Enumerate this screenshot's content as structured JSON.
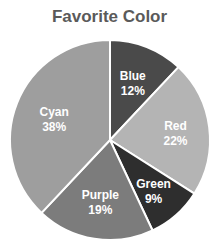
{
  "chart_data": {
    "type": "pie",
    "title": "Favorite Color",
    "categories": [
      "Blue",
      "Red",
      "Green",
      "Purple",
      "Cyan"
    ],
    "values": [
      12,
      22,
      9,
      19,
      38
    ],
    "unit": "%",
    "start_angle": "12 o'clock",
    "direction": "clockwise",
    "slice_colors": [
      "#4a4a4a",
      "#b4b4b4",
      "#2e2e2e",
      "#7c7c7c",
      "#9e9e9e"
    ],
    "legend": "none (labels inside slices)"
  },
  "labels": [
    {
      "name": "Blue",
      "pct": "12%"
    },
    {
      "name": "Red",
      "pct": "22%"
    },
    {
      "name": "Green",
      "pct": "9%"
    },
    {
      "name": "Purple",
      "pct": "19%"
    },
    {
      "name": "Cyan",
      "pct": "38%"
    }
  ]
}
